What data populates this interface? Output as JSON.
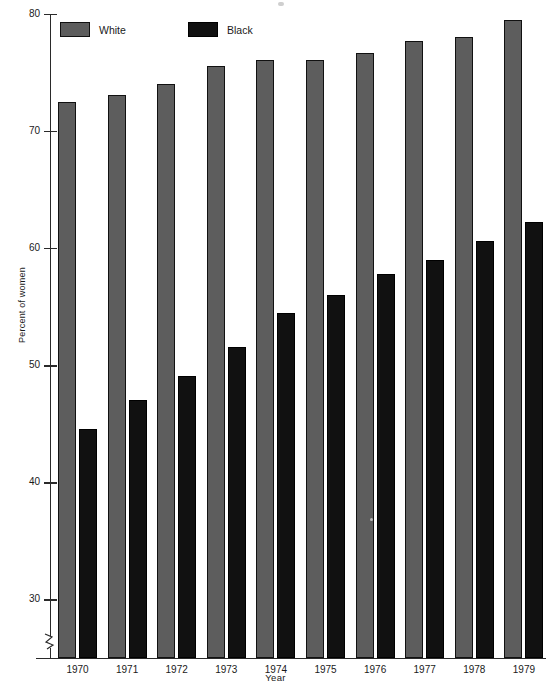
{
  "chart_data": {
    "type": "bar",
    "title": "",
    "xlabel": "Year",
    "ylabel": "Percent of women",
    "categories": [
      "1970",
      "1971",
      "1972",
      "1973",
      "1974",
      "1975",
      "1976",
      "1977",
      "1978",
      "1979"
    ],
    "series": [
      {
        "name": "White",
        "color": "#5d5d5d",
        "values": [
          72.5,
          73.1,
          74.0,
          75.6,
          76.1,
          76.1,
          76.7,
          77.7,
          78.0,
          79.5
        ]
      },
      {
        "name": "Black",
        "color": "#111111",
        "values": [
          44.6,
          47.0,
          49.1,
          51.6,
          54.5,
          56.0,
          57.8,
          59.0,
          60.6,
          62.2
        ]
      }
    ],
    "ylim": [
      25,
      80
    ],
    "yticks": [
      30,
      40,
      50,
      60,
      70,
      80
    ],
    "ytick_labels": [
      "30",
      "40",
      "50",
      "60",
      "70",
      "80"
    ],
    "axis_break": true,
    "grid": false,
    "legend_position": "top-left"
  },
  "legend": {
    "items": [
      {
        "label": "White",
        "swatch": "gray-swatch"
      },
      {
        "label": "Black",
        "swatch": "black-swatch"
      }
    ]
  }
}
